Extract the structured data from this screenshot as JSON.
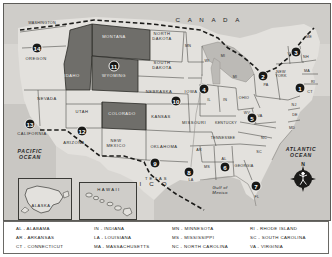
{
  "figure": {
    "kind": "united-states-regional-map",
    "colors": {
      "highlight_fill": "#6f6e6a",
      "land_fill": "#e3e1dd",
      "water_fill": "#c9c7c3",
      "border": "#2b2b27",
      "marker_fill": "#181816",
      "marker_text": "#ffffff"
    }
  },
  "geo_labels": {
    "canada": "C A N A D A",
    "mexico": "M E X I C O",
    "pacific_ocean": "PACIFIC\nOCEAN",
    "pacific_line1": "PACIFIC",
    "pacific_line2": "OCEAN",
    "atlantic_line1": "ATLANTIC",
    "atlantic_line2": "OCEAN",
    "gulf_line1": "Gulf of",
    "gulf_line2": "Mexico",
    "hawaii_inset": "HAWAII",
    "alaska_inset": "ALASKA"
  },
  "compass": {
    "north_label": "N"
  },
  "states": [
    {
      "abbr": "WA",
      "label": "WASHINGTON",
      "x": 38,
      "y": 19,
      "shaded": false,
      "size": "tiny"
    },
    {
      "abbr": "OR",
      "label": "OREGON",
      "x": 32,
      "y": 55,
      "shaded": false,
      "size": "normal"
    },
    {
      "abbr": "ID",
      "label": "IDAHO",
      "x": 68,
      "y": 72,
      "shaded": true,
      "size": "normal"
    },
    {
      "abbr": "MT",
      "label": "MONTANA",
      "x": 110,
      "y": 33,
      "shaded": true,
      "size": "normal"
    },
    {
      "abbr": "ND",
      "label": "NORTH\nDAKOTA",
      "x": 158,
      "y": 33,
      "shaded": false,
      "size": "normal"
    },
    {
      "abbr": "SD",
      "label": "SOUTH\nDAKOTA",
      "x": 158,
      "y": 62,
      "shaded": false,
      "size": "normal"
    },
    {
      "abbr": "WY",
      "label": "WYOMING",
      "x": 110,
      "y": 72,
      "shaded": true,
      "size": "normal"
    },
    {
      "abbr": "NE",
      "label": "NEBRASKA",
      "x": 155,
      "y": 88,
      "shaded": false,
      "size": "normal"
    },
    {
      "abbr": "NV",
      "label": "NEVADA",
      "x": 43,
      "y": 95,
      "shaded": false,
      "size": "normal"
    },
    {
      "abbr": "UT",
      "label": "UTAH",
      "x": 78,
      "y": 108,
      "shaded": false,
      "size": "normal"
    },
    {
      "abbr": "CO",
      "label": "COLORADO",
      "x": 118,
      "y": 110,
      "shaded": true,
      "size": "normal"
    },
    {
      "abbr": "CA",
      "label": "CALIFORNIA",
      "x": 28,
      "y": 130,
      "shaded": false,
      "size": "normal"
    },
    {
      "abbr": "AZ",
      "label": "ARIZONA",
      "x": 70,
      "y": 139,
      "shaded": false,
      "size": "normal"
    },
    {
      "abbr": "NM",
      "label": "NEW\nMEXICO",
      "x": 112,
      "y": 140,
      "shaded": false,
      "size": "normal"
    },
    {
      "abbr": "KS",
      "label": "KANSAS",
      "x": 157,
      "y": 113,
      "shaded": false,
      "size": "normal"
    },
    {
      "abbr": "OK",
      "label": "OKLAHOMA",
      "x": 160,
      "y": 143,
      "shaded": false,
      "size": "normal"
    },
    {
      "abbr": "TX",
      "label": "T E X A S",
      "x": 152,
      "y": 175,
      "shaded": false,
      "size": "normal"
    },
    {
      "abbr": "MN",
      "label": "MN",
      "x": 184,
      "y": 42,
      "shaded": false,
      "size": "tiny"
    },
    {
      "abbr": "IA",
      "label": "IOWA",
      "x": 187,
      "y": 88,
      "shaded": false,
      "size": "normal"
    },
    {
      "abbr": "WI",
      "label": "WI",
      "x": 203,
      "y": 57,
      "shaded": false,
      "size": "tiny"
    },
    {
      "abbr": "MI-up",
      "label": "MI",
      "x": 219,
      "y": 52,
      "shaded": false,
      "size": "tiny"
    },
    {
      "abbr": "MI",
      "label": "MI",
      "x": 231,
      "y": 73,
      "shaded": false,
      "size": "tiny"
    },
    {
      "abbr": "IL",
      "label": "IL",
      "x": 205,
      "y": 96,
      "shaded": false,
      "size": "tiny"
    },
    {
      "abbr": "IN",
      "label": "IN",
      "x": 221,
      "y": 96,
      "shaded": false,
      "size": "tiny"
    },
    {
      "abbr": "OH",
      "label": "OHIO",
      "x": 240,
      "y": 94,
      "shaded": false,
      "size": "tiny"
    },
    {
      "abbr": "MO",
      "label": "MISSOURI",
      "x": 190,
      "y": 119,
      "shaded": false,
      "size": "normal"
    },
    {
      "abbr": "KY",
      "label": "KENTUCKY",
      "x": 222,
      "y": 119,
      "shaded": false,
      "size": "tiny"
    },
    {
      "abbr": "TN",
      "label": "TENNESSEE",
      "x": 219,
      "y": 134,
      "shaded": false,
      "size": "tiny"
    },
    {
      "abbr": "AR",
      "label": "AR",
      "x": 195,
      "y": 146,
      "shaded": false,
      "size": "tiny"
    },
    {
      "abbr": "MS",
      "label": "MS",
      "x": 203,
      "y": 163,
      "shaded": false,
      "size": "tiny"
    },
    {
      "abbr": "AL",
      "label": "AL",
      "x": 220,
      "y": 155,
      "shaded": false,
      "size": "tiny"
    },
    {
      "abbr": "GA",
      "label": "GEORGIA",
      "x": 240,
      "y": 162,
      "shaded": false,
      "size": "tiny"
    },
    {
      "abbr": "LA",
      "label": "LA",
      "x": 187,
      "y": 176,
      "shaded": false,
      "size": "tiny"
    },
    {
      "abbr": "FL",
      "label": "FL",
      "x": 253,
      "y": 193,
      "shaded": false,
      "size": "tiny"
    },
    {
      "abbr": "SC",
      "label": "SC",
      "x": 255,
      "y": 148,
      "shaded": false,
      "size": "tiny"
    },
    {
      "abbr": "NC",
      "label": "NC",
      "x": 260,
      "y": 134,
      "shaded": false,
      "size": "tiny"
    },
    {
      "abbr": "VA",
      "label": "VA",
      "x": 256,
      "y": 112,
      "shaded": false,
      "size": "tiny"
    },
    {
      "abbr": "WV",
      "label": "WV",
      "x": 243,
      "y": 109,
      "shaded": false,
      "size": "tiny"
    },
    {
      "abbr": "PA",
      "label": "PA",
      "x": 262,
      "y": 81,
      "shaded": false,
      "size": "tiny"
    },
    {
      "abbr": "NY",
      "label": "NEW\nYORK",
      "x": 277,
      "y": 70,
      "shaded": false,
      "size": "tiny"
    },
    {
      "abbr": "VT",
      "label": "VT",
      "x": 286,
      "y": 50,
      "shaded": false,
      "size": "tiny"
    },
    {
      "abbr": "NH",
      "label": "NH",
      "x": 302,
      "y": 53,
      "shaded": false,
      "size": "tiny"
    },
    {
      "abbr": "ME",
      "label": "ME",
      "x": 305,
      "y": 33,
      "shaded": false,
      "size": "tiny"
    },
    {
      "abbr": "MA",
      "label": "MA",
      "x": 303,
      "y": 67,
      "shaded": false,
      "size": "tiny"
    },
    {
      "abbr": "RI",
      "label": "RI",
      "x": 309,
      "y": 78,
      "shaded": false,
      "size": "tiny"
    },
    {
      "abbr": "CT",
      "label": "CT",
      "x": 306,
      "y": 88,
      "shaded": false,
      "size": "tiny"
    },
    {
      "abbr": "NJ",
      "label": "NJ",
      "x": 290,
      "y": 101,
      "shaded": false,
      "size": "tiny"
    },
    {
      "abbr": "DE",
      "label": "DE",
      "x": 291,
      "y": 111,
      "shaded": false,
      "size": "tiny"
    },
    {
      "abbr": "MD",
      "label": "MD",
      "x": 288,
      "y": 124,
      "shaded": false,
      "size": "tiny"
    }
  ],
  "markers": [
    {
      "number": "1",
      "x": 296,
      "y": 84,
      "region": "connecticut-southern-new-england"
    },
    {
      "number": "2",
      "x": 259,
      "y": 72,
      "region": "pennsylvania"
    },
    {
      "number": "3",
      "x": 292,
      "y": 48,
      "region": "new-hampshire"
    },
    {
      "number": "4",
      "x": 200,
      "y": 85,
      "region": "illinois-wisconsin"
    },
    {
      "number": "5",
      "x": 248,
      "y": 114,
      "region": "west-virginia-virginia"
    },
    {
      "number": "6",
      "x": 221,
      "y": 163,
      "region": "alabama"
    },
    {
      "number": "7",
      "x": 252,
      "y": 182,
      "region": "florida"
    },
    {
      "number": "8",
      "x": 185,
      "y": 168,
      "region": "louisiana"
    },
    {
      "number": "9",
      "x": 151,
      "y": 159,
      "region": "texas"
    },
    {
      "number": "10",
      "x": 172,
      "y": 97,
      "region": "kansas-missouri"
    },
    {
      "number": "11",
      "x": 110,
      "y": 62,
      "region": "wyoming"
    },
    {
      "number": "12",
      "x": 78,
      "y": 127,
      "region": "arizona"
    },
    {
      "number": "13",
      "x": 26,
      "y": 120,
      "region": "california"
    },
    {
      "number": "14",
      "x": 33,
      "y": 44,
      "region": "oregon"
    },
    {
      "number": "15",
      "x": 34,
      "y": 186,
      "region": "alaska"
    },
    {
      "number": "16",
      "x": 99,
      "y": 201,
      "region": "hawaii"
    }
  ],
  "legend": {
    "entries": [
      "AL - ALABAMA",
      "AR - ARKANSAS",
      "CT - CONNECTICUT",
      "IN - INDIANA",
      "LA - LOUISIANA",
      "MA - MASSACHUSETTS",
      "MN - MINNESOTA",
      "MS - MISSISSIPPI",
      "NC - NORTH CAROLINA",
      "RI - RHODE ISLAND",
      "SC - SOUTH CAROLINA",
      "VA - VIRGINIA"
    ]
  }
}
